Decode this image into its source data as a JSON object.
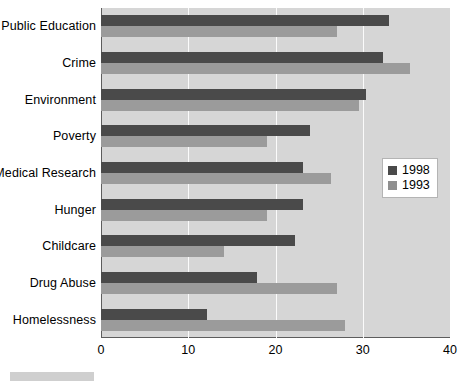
{
  "chart_data": {
    "type": "bar",
    "orientation": "horizontal",
    "title": "",
    "subtitle": "",
    "xlabel": "",
    "ylabel": "",
    "xlim": [
      0,
      40
    ],
    "xticks": [
      0,
      10,
      20,
      30,
      40
    ],
    "grid": true,
    "legend_position": "right-middle",
    "categories": [
      "Public Education",
      "Crime",
      "Environment",
      "Poverty",
      "Medical Research",
      "Hunger",
      "Childcare",
      "Drug Abuse",
      "Homelessness"
    ],
    "series": [
      {
        "name": "1998",
        "color": "#4a4a4a",
        "values": [
          33.0,
          32.3,
          30.4,
          24.0,
          23.2,
          23.2,
          22.2,
          17.9,
          12.1
        ]
      },
      {
        "name": "1993",
        "color": "#9b9b9b",
        "values": [
          27.0,
          35.4,
          29.6,
          19.0,
          26.4,
          19.0,
          14.1,
          27.0,
          28.0
        ]
      }
    ]
  },
  "legend": {
    "entries": [
      {
        "label": "1998",
        "color": "#4a4a4a"
      },
      {
        "label": "1993",
        "color": "#8f8f8f"
      }
    ]
  },
  "axis": {
    "x_tick_labels": [
      "0",
      "10",
      "20",
      "30",
      "40"
    ]
  },
  "colors": {
    "plot_background": "#d6d6d6",
    "page_background": "#ffffff",
    "gridline": "#fbfbfb",
    "axis": "#5d5d5d",
    "series_1998": "#4a4a4a",
    "series_1993": "#9b9b9b"
  }
}
